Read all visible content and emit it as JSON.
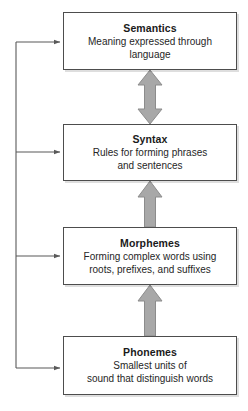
{
  "diagram": {
    "type": "hierarchy-flow",
    "title": "",
    "background_color": "#ffffff",
    "box_border_color": "#4d4d4d",
    "box_fill_color": "#ffffff",
    "block_arrow_color": "#a8a8a8",
    "block_arrow_border_color": "#8c8c8c",
    "connector_line_color": "#595959",
    "levels": [
      {
        "id": "semantics",
        "title": "Semantics",
        "description": "Meaning expressed through language",
        "desc_lines": [
          "Meaning expressed through",
          "language"
        ],
        "box": {
          "x": 63,
          "y": 12,
          "w": 174,
          "h": 58
        }
      },
      {
        "id": "syntax",
        "title": "Syntax",
        "description": "Rules for forming phrases and sentences",
        "desc_lines": [
          "Rules for forming phrases",
          "and sentences"
        ],
        "box": {
          "x": 63,
          "y": 124,
          "w": 174,
          "h": 57
        }
      },
      {
        "id": "morphemes",
        "title": "Morphemes",
        "description": "Forming complex words using roots, prefixes, and suffixes",
        "desc_lines": [
          "Forming complex words using",
          "roots, prefixes, and suffixes"
        ],
        "box": {
          "x": 63,
          "y": 227,
          "w": 174,
          "h": 58
        }
      },
      {
        "id": "phonemes",
        "title": "Phonemes",
        "description": "Smallest units of sound that distinguish words",
        "desc_lines": [
          "Smallest units of",
          "sound that distinguish words"
        ],
        "box": {
          "x": 63,
          "y": 336,
          "w": 174,
          "h": 59
        }
      }
    ],
    "block_arrows": [
      {
        "id": "semantics-syntax-arrow",
        "direction": "both",
        "from": "syntax",
        "to": "semantics",
        "x_center": 150,
        "y_top": 70,
        "y_bottom": 124
      },
      {
        "id": "syntax-morphemes-arrow",
        "direction": "up",
        "from": "morphemes",
        "to": "syntax",
        "x_center": 150,
        "y_top": 181,
        "y_bottom": 227
      },
      {
        "id": "morphemes-phonemes-arrow",
        "direction": "up",
        "from": "phonemes",
        "to": "morphemes",
        "x_center": 150,
        "y_top": 285,
        "y_bottom": 336
      }
    ],
    "feedback_connector": {
      "id": "feedback-trunk",
      "description": "Left-side trunk with branch arrows feeding into every level",
      "trunk_x": 16,
      "trunk_y_top": 42,
      "trunk_y_bottom": 368,
      "branch_target_x": 63,
      "branches": [
        {
          "id": "branch-to-semantics",
          "target": "semantics",
          "y": 42
        },
        {
          "id": "branch-to-syntax",
          "target": "syntax",
          "y": 152
        },
        {
          "id": "branch-to-morphemes",
          "target": "morphemes",
          "y": 256
        },
        {
          "id": "branch-to-phonemes",
          "target": "phonemes",
          "y": 368
        }
      ]
    }
  }
}
